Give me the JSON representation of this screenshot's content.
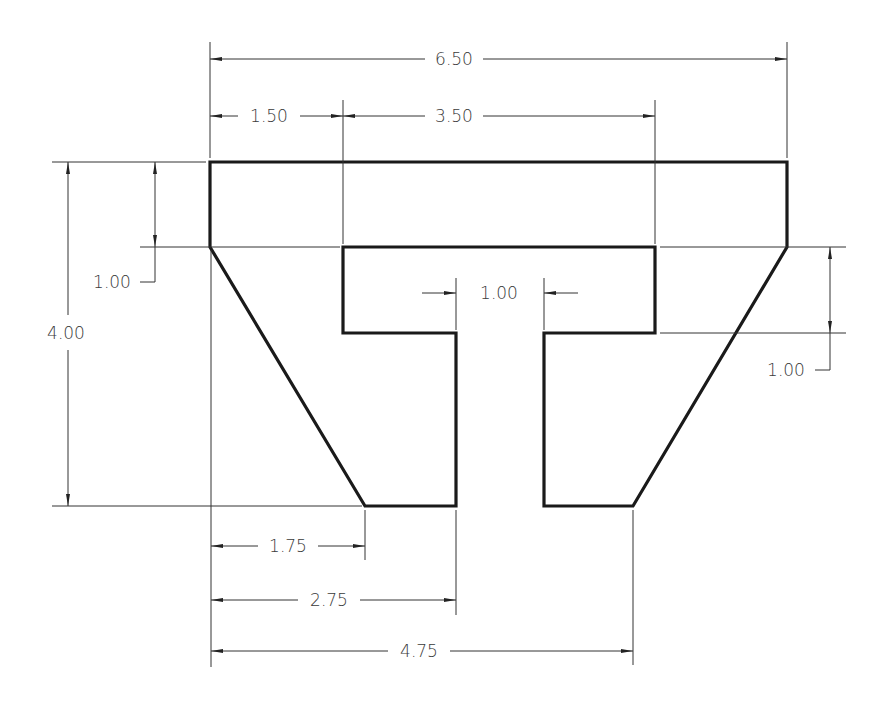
{
  "drawing": {
    "title": "T-shaped part with dimensions",
    "colors": {
      "object_line": "#1a1a1a",
      "dimension_line": "#333333",
      "text": "#3a3a3a",
      "background": "#ffffff"
    },
    "dimensions": {
      "overall_width": "6.50",
      "left_flange_width": "1.50",
      "inner_width": "3.50",
      "overall_height": "4.00",
      "top_bar_thickness": "1.00",
      "stem_gap": "1.00",
      "inner_bar_thickness": "1.00",
      "left_foot_offset": "1.75",
      "left_stem_offset": "2.75",
      "right_foot_offset": "4.75"
    }
  }
}
